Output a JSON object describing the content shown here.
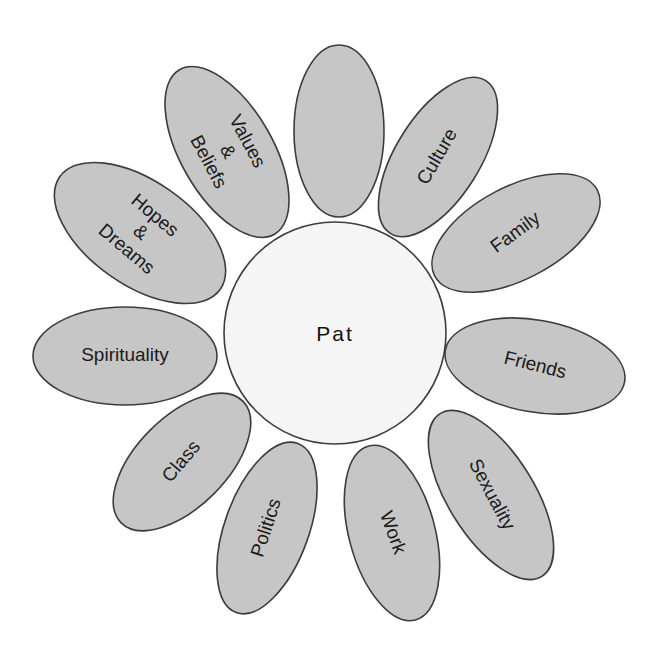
{
  "diagram": {
    "type": "identity-flower",
    "center": {
      "label": "Pat",
      "cx": 335,
      "cy": 333,
      "r": 111
    },
    "colors": {
      "petal_fill": "#c6c6c6",
      "center_fill": "#f5f5f5",
      "stroke": "#3c3c3c",
      "text": "#1a1a1a"
    },
    "petals": [
      {
        "id": "top-blank",
        "lines": [],
        "cx": 339,
        "cy": 131,
        "rx": 45,
        "ry": 86,
        "rot": 0,
        "text_rot": 0
      },
      {
        "id": "culture",
        "lines": [
          "Culture"
        ],
        "cx": 438,
        "cy": 157,
        "rx": 42,
        "ry": 90,
        "rot": 32,
        "text_rot": -60
      },
      {
        "id": "family",
        "lines": [
          "Family"
        ],
        "cx": 516,
        "cy": 233,
        "rx": 46,
        "ry": 92,
        "rot": 62,
        "text_rot": -36
      },
      {
        "id": "friends",
        "lines": [
          "Friends"
        ],
        "cx": 535,
        "cy": 366,
        "rx": 46,
        "ry": 91,
        "rot": 100,
        "text_rot": 14
      },
      {
        "id": "sexuality",
        "lines": [
          "Sexuality"
        ],
        "cx": 491,
        "cy": 495,
        "rx": 43,
        "ry": 96,
        "rot": -32,
        "text_rot": 62
      },
      {
        "id": "work",
        "lines": [
          "Work"
        ],
        "cx": 392,
        "cy": 533,
        "rx": 43,
        "ry": 90,
        "rot": -15,
        "text_rot": 70
      },
      {
        "id": "politics",
        "lines": [
          "Politics"
        ],
        "cx": 267,
        "cy": 528,
        "rx": 42,
        "ry": 90,
        "rot": 20,
        "text_rot": -72
      },
      {
        "id": "class",
        "lines": [
          "Class"
        ],
        "cx": 182,
        "cy": 462,
        "rx": 45,
        "ry": 86,
        "rot": 45,
        "text_rot": -50
      },
      {
        "id": "spirituality",
        "lines": [
          "Spirituality"
        ],
        "cx": 125,
        "cy": 356,
        "rx": 92,
        "ry": 49,
        "rot": 0,
        "text_rot": 0
      },
      {
        "id": "hopes-dreams",
        "lines": [
          "Hopes",
          "&",
          "Dreams"
        ],
        "cx": 140,
        "cy": 233,
        "rx": 52,
        "ry": 98,
        "rot": -55,
        "text_rot": 40
      },
      {
        "id": "values-beliefs",
        "lines": [
          "Values",
          "&",
          "Beliefs"
        ],
        "cx": 227,
        "cy": 152,
        "rx": 46,
        "ry": 95,
        "rot": -30,
        "text_rot": 62
      }
    ]
  }
}
